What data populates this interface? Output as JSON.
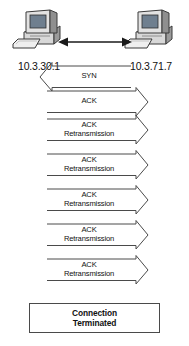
{
  "diagram": {
    "type": "network-sequence-diagram",
    "background_color": "#ffffff",
    "line_color": "#4a4a4a",
    "text_color": "#111111"
  },
  "hosts": [
    {
      "id": "host-left",
      "ip": "10.3.30.1",
      "icon": "desktop-computer-icon",
      "position": "left"
    },
    {
      "id": "host-right",
      "ip": "10.3.71.7",
      "icon": "desktop-computer-icon",
      "position": "right"
    }
  ],
  "link": {
    "icon": "double-headed-arrow-icon",
    "direction": "bidirectional"
  },
  "messages": [
    {
      "index": 0,
      "line1": "SYN",
      "line2": "",
      "direction": "right-to-left",
      "arrowhead": "left"
    },
    {
      "index": 1,
      "line1": "ACK",
      "line2": "",
      "direction": "left-to-right",
      "arrowhead": "right"
    },
    {
      "index": 2,
      "line1": "ACK",
      "line2": "Retransmission",
      "direction": "left-to-right",
      "arrowhead": "right"
    },
    {
      "index": 3,
      "line1": "ACK",
      "line2": "Retransmission",
      "direction": "left-to-right",
      "arrowhead": "right"
    },
    {
      "index": 4,
      "line1": "ACK",
      "line2": "Retransmission",
      "direction": "left-to-right",
      "arrowhead": "right"
    },
    {
      "index": 5,
      "line1": "ACK",
      "line2": "Retransmission",
      "direction": "left-to-right",
      "arrowhead": "right"
    },
    {
      "index": 6,
      "line1": "ACK",
      "line2": "Retransmission",
      "direction": "left-to-right",
      "arrowhead": "right"
    }
  ],
  "terminated": {
    "line1": "Connection",
    "line2": "Terminated"
  }
}
